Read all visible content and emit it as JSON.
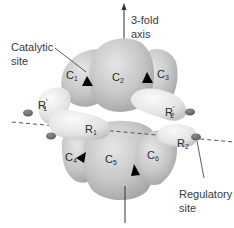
{
  "figure": {
    "annotations": {
      "catalytic_line1": "Catalytic",
      "catalytic_line2": "site",
      "axis_line1": "3-fold",
      "axis_line2": "axis",
      "regulatory_line1": "Regulatory",
      "regulatory_line2": "site"
    },
    "subunits": {
      "c1": {
        "letter": "C",
        "index": "1"
      },
      "c2": {
        "letter": "C",
        "index": "2"
      },
      "c3": {
        "letter": "C",
        "index": "3"
      },
      "c4": {
        "letter": "C",
        "index": "4"
      },
      "c5": {
        "letter": "C",
        "index": "5"
      },
      "c6": {
        "letter": "C",
        "index": "6"
      },
      "r1": {
        "letter": "R",
        "index": "1",
        "prime": ""
      },
      "r1p": {
        "letter": "R",
        "index": "1",
        "prime": "′"
      },
      "r2": {
        "letter": "R",
        "index": "2",
        "prime": ""
      },
      "r2p": {
        "letter": "R",
        "index": "2",
        "prime": "′"
      }
    },
    "colors": {
      "catalytic_fill": "#c8c8c8",
      "catalytic_shade": "#a9a9a9",
      "regulatory_fill": "#e4e4e4",
      "regulatory_site_dot": "#6f766d",
      "active_site_triangle": "#000000",
      "axis_line": "#333333",
      "label_text": "#3a3a3a"
    }
  }
}
